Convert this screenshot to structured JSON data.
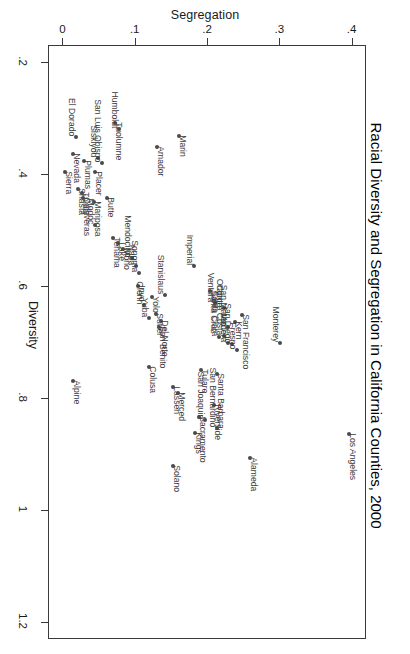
{
  "chart_title": "Racial Diversity and Segregation in California Counties, 2000",
  "orientation": "rotated-90-clockwise",
  "axes": {
    "segregation": {
      "label": "Segregation",
      "position": "top",
      "ticks": [
        "0",
        ".1",
        ".2",
        ".3",
        ".4"
      ],
      "tick_values": [
        0,
        0.1,
        0.2,
        0.3,
        0.4
      ],
      "range": [
        -0.02,
        0.42
      ]
    },
    "diversity": {
      "label": "Diversity",
      "position": "left",
      "ticks": [
        ".2",
        ".4",
        ".6",
        ".8",
        "1",
        "1.2"
      ],
      "tick_values": [
        0.2,
        0.4,
        0.6,
        0.8,
        1.0,
        1.2
      ],
      "range": [
        0.17,
        1.23
      ]
    }
  },
  "chart_data": {
    "type": "scatter",
    "title": "Racial Diversity and Segregation in California Counties, 2000",
    "xlabel": "Segregation",
    "ylabel": "Diversity",
    "xlim": [
      -0.02,
      0.42
    ],
    "ylim": [
      0.17,
      1.23
    ],
    "grid": false,
    "legend": null,
    "point_label_field": "county",
    "points": [
      {
        "county": "Sierra",
        "x": 0.002,
        "y": 0.395,
        "side": "right"
      },
      {
        "county": "Shasta",
        "x": 0.02,
        "y": 0.425,
        "side": "right"
      },
      {
        "county": "Trinity",
        "x": 0.026,
        "y": 0.432,
        "side": "right"
      },
      {
        "county": "Calaveras",
        "x": 0.027,
        "y": 0.442,
        "side": "right"
      },
      {
        "county": "Nevada",
        "x": 0.013,
        "y": 0.362,
        "side": "right"
      },
      {
        "county": "Plumas",
        "x": 0.028,
        "y": 0.375,
        "side": "right"
      },
      {
        "county": "Mariposa",
        "x": 0.042,
        "y": 0.448,
        "side": "right"
      },
      {
        "county": "Modoc",
        "x": 0.043,
        "y": 0.49,
        "side": "left"
      },
      {
        "county": "El Dorado",
        "x": 0.018,
        "y": 0.332,
        "side": "left"
      },
      {
        "county": "Placer",
        "x": 0.043,
        "y": 0.395,
        "side": "right"
      },
      {
        "county": "Butte",
        "x": 0.06,
        "y": 0.442,
        "side": "right"
      },
      {
        "county": "Siskiyou",
        "x": 0.048,
        "y": 0.37,
        "side": "left"
      },
      {
        "county": "San Luis Obispo",
        "x": 0.053,
        "y": 0.378,
        "side": "left"
      },
      {
        "county": "Tuolumne",
        "x": 0.072,
        "y": 0.308,
        "side": "right"
      },
      {
        "county": "Humboldt",
        "x": 0.077,
        "y": 0.318,
        "side": "left"
      },
      {
        "county": "Tehama",
        "x": 0.068,
        "y": 0.512,
        "side": "right"
      },
      {
        "county": "Lake",
        "x": 0.076,
        "y": 0.522,
        "side": "right"
      },
      {
        "county": "Mono",
        "x": 0.082,
        "y": 0.532,
        "side": "right"
      },
      {
        "county": "Mendocino",
        "x": 0.095,
        "y": 0.548,
        "side": "left"
      },
      {
        "county": "Napa",
        "x": 0.1,
        "y": 0.562,
        "side": "left"
      },
      {
        "county": "Sonoma",
        "x": 0.104,
        "y": 0.575,
        "side": "left"
      },
      {
        "county": "Inyo",
        "x": 0.103,
        "y": 0.598,
        "side": "right"
      },
      {
        "county": "Glenn",
        "x": 0.112,
        "y": 0.632,
        "side": "left"
      },
      {
        "county": "Yuba",
        "x": 0.118,
        "y": 0.655,
        "side": "left"
      },
      {
        "county": "Yolo",
        "x": 0.122,
        "y": 0.618,
        "side": "right"
      },
      {
        "county": "Sutter",
        "x": 0.128,
        "y": 0.648,
        "side": "right"
      },
      {
        "county": "San Benito",
        "x": 0.132,
        "y": 0.672,
        "side": "right"
      },
      {
        "county": "Del Norte",
        "x": 0.135,
        "y": 0.66,
        "side": "right"
      },
      {
        "county": "Stanislaus",
        "x": 0.14,
        "y": 0.615,
        "side": "left"
      },
      {
        "county": "Colusa",
        "x": 0.118,
        "y": 0.742,
        "side": "right"
      },
      {
        "county": "Alpine",
        "x": 0.013,
        "y": 0.768,
        "side": "right"
      },
      {
        "county": "Amador",
        "x": 0.13,
        "y": 0.35,
        "side": "right"
      },
      {
        "county": "Marin",
        "x": 0.16,
        "y": 0.33,
        "side": "right"
      },
      {
        "county": "Imperial",
        "x": 0.18,
        "y": 0.562,
        "side": "left"
      },
      {
        "county": "Santa Cruz",
        "x": 0.203,
        "y": 0.608,
        "side": "right"
      },
      {
        "county": "Ventura",
        "x": 0.21,
        "y": 0.628,
        "side": "left"
      },
      {
        "county": "Orange",
        "x": 0.222,
        "y": 0.638,
        "side": "left"
      },
      {
        "county": "Madera",
        "x": 0.228,
        "y": 0.7,
        "side": "left"
      },
      {
        "county": "Santa Clara",
        "x": 0.215,
        "y": 0.69,
        "side": "left"
      },
      {
        "county": "Contra Costa",
        "x": 0.222,
        "y": 0.688,
        "side": "left"
      },
      {
        "county": "San Mateo",
        "x": 0.228,
        "y": 0.672,
        "side": "left"
      },
      {
        "county": "San Diego",
        "x": 0.233,
        "y": 0.702,
        "side": "left"
      },
      {
        "county": "Fresno",
        "x": 0.24,
        "y": 0.712,
        "side": "left"
      },
      {
        "county": "Kern",
        "x": 0.238,
        "y": 0.662,
        "side": "right"
      },
      {
        "county": "San Francisco",
        "x": 0.247,
        "y": 0.65,
        "side": "right"
      },
      {
        "county": "Santa Barbara",
        "x": 0.212,
        "y": 0.755,
        "side": "right"
      },
      {
        "county": "Tulare",
        "x": 0.19,
        "y": 0.748,
        "side": "right"
      },
      {
        "county": "Lassen",
        "x": 0.152,
        "y": 0.778,
        "side": "right"
      },
      {
        "county": "Merced",
        "x": 0.158,
        "y": 0.79,
        "side": "right"
      },
      {
        "county": "Riverside",
        "x": 0.208,
        "y": 0.81,
        "side": "right"
      },
      {
        "county": "Sacramento",
        "x": 0.188,
        "y": 0.832,
        "side": "right"
      },
      {
        "county": "San Joaquin",
        "x": 0.196,
        "y": 0.838,
        "side": "left"
      },
      {
        "county": "Kings",
        "x": 0.182,
        "y": 0.86,
        "side": "right"
      },
      {
        "county": "San Bernardino",
        "x": 0.212,
        "y": 0.852,
        "side": "left"
      },
      {
        "county": "Solano",
        "x": 0.152,
        "y": 0.92,
        "side": "right"
      },
      {
        "county": "Alameda",
        "x": 0.258,
        "y": 0.905,
        "side": "right"
      },
      {
        "county": "Monterey",
        "x": 0.3,
        "y": 0.7,
        "side": "left"
      },
      {
        "county": "Los Angeles",
        "x": 0.395,
        "y": 0.862,
        "side": "right"
      }
    ]
  }
}
